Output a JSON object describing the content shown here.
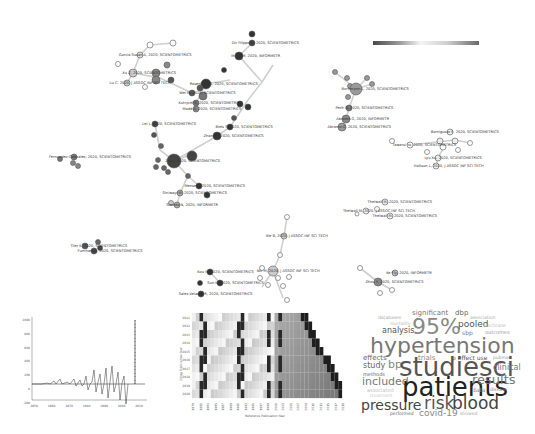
{
  "network": {
    "colorbar": {
      "gradient": [
        "#4a4a4a",
        "#9a9a9a",
        "#f4f4f4",
        "#cfcfcf",
        "#6a6a6a"
      ]
    },
    "nodes": [
      {
        "label": "Garcia Susan A, 2020, SCIENTOMETRICS",
        "x": 140,
        "y": 55,
        "r": 3,
        "fill": "#ddd"
      },
      {
        "label": "Xu Z, 2020, SCIENTOMETRICS",
        "x": 133,
        "y": 73,
        "r": 4,
        "fill": "#ccc"
      },
      {
        "label": "Lu C, 2020, J ASSOC INF SCI TECH",
        "x": 127,
        "y": 83,
        "r": 3,
        "fill": "#ccc"
      },
      {
        "label": "Dir Filippo D, 2020, SCIENTOMETRICS",
        "x": 252,
        "y": 43,
        "r": 3,
        "fill": "#444"
      },
      {
        "label": "Mund M, 2020, INFORMETR",
        "x": 239,
        "y": 56,
        "r": 4,
        "fill": "#333"
      },
      {
        "label": "Wei M, 2020, SCIENTOMETRICS",
        "x": 192,
        "y": 93,
        "r": 3,
        "fill": "#555"
      },
      {
        "label": "Rosenberg K, 2020, SCIENTOMETRICS",
        "x": 206,
        "y": 84,
        "r": 5,
        "fill": "#333"
      },
      {
        "label": "Kutrycel E, 2020, SCIENTOMETRICS",
        "x": 196,
        "y": 103,
        "r": 3,
        "fill": "#777"
      },
      {
        "label": "Madd A, 2020, SCIENTOMETRICS",
        "x": 196,
        "y": 109,
        "r": 3,
        "fill": "#888"
      },
      {
        "label": "Lei L, 2020, SCIENTOMETRICS",
        "x": 155,
        "y": 124,
        "r": 3,
        "fill": "#444"
      },
      {
        "label": "Biels S, 2020, SCIENTOMETRICS",
        "x": 230,
        "y": 127,
        "r": 3,
        "fill": "#333"
      },
      {
        "label": "Zhang L, 2020, SCIENTOMETRICS",
        "x": 217,
        "y": 136,
        "r": 4,
        "fill": "#333"
      },
      {
        "label": "Zhu J, 2020, SCIENTOMETRICS",
        "x": 174,
        "y": 161,
        "r": 7,
        "fill": "#444"
      },
      {
        "label": "Fernandez-Gonzalez, 2020, SCIENTOMETRICS",
        "x": 74,
        "y": 157,
        "r": 3,
        "fill": "#777"
      },
      {
        "label": "Mense E, 2020, SCIENTOMETRICS",
        "x": 199,
        "y": 186,
        "r": 3,
        "fill": "#333"
      },
      {
        "label": "Siniwayi M, 2020, SCIENTOMETRICS",
        "x": 180,
        "y": 193,
        "r": 3,
        "fill": "#aaa"
      },
      {
        "label": "Simoes N, 2020, INFORMETR",
        "x": 177,
        "y": 205,
        "r": 3,
        "fill": "#aaa"
      },
      {
        "label": "Bornmann L, 2020, SCIENTOMETRICS",
        "x": 356,
        "y": 89,
        "r": 6,
        "fill": "#999"
      },
      {
        "label": "Pech G, 2020, SCIENTOMETRICS",
        "x": 349,
        "y": 108,
        "r": 3,
        "fill": "#777"
      },
      {
        "label": "Abramo G, 2020, INFORMETR",
        "x": 346,
        "y": 119,
        "r": 4,
        "fill": "#888"
      },
      {
        "label": "Abramo G, 2020, SCIENTOMETRICS",
        "x": 342,
        "y": 127,
        "r": 4,
        "fill": "#999"
      },
      {
        "label": "Bornigusar F, 2020, SCIENTOMETRICS",
        "x": 450,
        "y": 132,
        "r": 3,
        "fill": "#eee"
      },
      {
        "label": "Tawarsi Ya, 2020, SCIENTOMETRICS",
        "x": 410,
        "y": 145,
        "r": 3,
        "fill": "#fff"
      },
      {
        "label": "Lyu Xu, 2020, SCIENTOMETRICS",
        "x": 438,
        "y": 158,
        "r": 3,
        "fill": "#eee"
      },
      {
        "label": "Haltsun L, 2020, J ASSOC INF SCI TECH",
        "x": 436,
        "y": 166,
        "r": 3,
        "fill": "#eee"
      },
      {
        "label": "Thelwall M, 2020, SCIENTOMETRICS",
        "x": 385,
        "y": 202,
        "r": 3,
        "fill": "#eee"
      },
      {
        "label": "Thelwall M, 2020, J ASSOC INF SCI TECH",
        "x": 366,
        "y": 211,
        "r": 3,
        "fill": "#eee"
      },
      {
        "label": "Thelwall M, 2020, SCIENTOMETRICS",
        "x": 390,
        "y": 216,
        "r": 3,
        "fill": "#eee"
      },
      {
        "label": "Xie B, 2020, J ASSOC INF SCI TECH",
        "x": 284,
        "y": 236,
        "r": 3,
        "fill": "#ccc"
      },
      {
        "label": "Kou M, 2020, SCIENTOMETRICS",
        "x": 210,
        "y": 272,
        "r": 3,
        "fill": "#333"
      },
      {
        "label": "Nic M, 2020, J ASSOC INF SCI TECH",
        "x": 273,
        "y": 271,
        "r": 5,
        "fill": "#ccc"
      },
      {
        "label": "Sun M, 2020, SCIENTOMETRICS",
        "x": 220,
        "y": 283,
        "r": 3,
        "fill": "#333"
      },
      {
        "label": "Sales-Velasco R, 2020, SCIENTOMETRICS",
        "x": 201,
        "y": 294,
        "r": 3,
        "fill": "#333"
      },
      {
        "label": "Ke Fly, 2020, INFORMETR",
        "x": 395,
        "y": 273,
        "r": 3,
        "fill": "#bbb"
      },
      {
        "label": "Zhou Y, 2020, SCIENTOMETRICS",
        "x": 378,
        "y": 282,
        "r": 4,
        "fill": "#888"
      },
      {
        "label": "Tiler K, 2020, SCIENTOMETRICS",
        "x": 85,
        "y": 246,
        "r": 3,
        "fill": "#555"
      },
      {
        "label": "Furnham A, 2020, SCIENTOMETRICS",
        "x": 94,
        "y": 251,
        "r": 3,
        "fill": "#444"
      }
    ]
  },
  "line_chart": {
    "x_ticks": [
      "1950",
      "1960",
      "1970",
      "1980",
      "1990",
      "2000",
      "2010"
    ],
    "y_ticks": [
      "1000",
      "800",
      "600",
      "400",
      "200",
      "0",
      "-200"
    ]
  },
  "heatmap": {
    "y_label": "Citing Publication Year",
    "x_label": "Reference Publication Year",
    "y_ticks": [
      "2011",
      "2012",
      "2013",
      "2014",
      "2015",
      "2016",
      "2017",
      "2018",
      "2019",
      "2020"
    ],
    "x_ticks": [
      "1979",
      "1981",
      "1983",
      "1985",
      "1987",
      "1989",
      "1991",
      "1993",
      "1995",
      "1997",
      "1999",
      "2001",
      "2003",
      "2005",
      "2007",
      "2009",
      "2011",
      "2013",
      "2015",
      "2017",
      "2019"
    ]
  },
  "wordcloud": {
    "words": [
      {
        "text": "significant",
        "x": 52,
        "y": 2,
        "size": 7,
        "color": "#777"
      },
      {
        "text": "dbp",
        "x": 95,
        "y": 2,
        "size": 7,
        "color": "#666"
      },
      {
        "text": "databases",
        "x": 18,
        "y": 8,
        "size": 4.5,
        "color": "#aaa"
      },
      {
        "text": "association",
        "x": 110,
        "y": 8,
        "size": 4.5,
        "color": "#aaa"
      },
      {
        "text": "mortality",
        "x": 30,
        "y": 14,
        "size": 4.5,
        "color": "#bbb"
      },
      {
        "text": "analysis",
        "x": 22,
        "y": 19,
        "size": 8,
        "color": "#555"
      },
      {
        "text": "95%",
        "x": 52,
        "y": 8,
        "size": 22,
        "color": "#888"
      },
      {
        "text": "pooled",
        "x": 98,
        "y": 12,
        "size": 9,
        "color": "#555"
      },
      {
        "text": "cochrane",
        "x": 125,
        "y": 16,
        "size": 4.5,
        "color": "#bbb"
      },
      {
        "text": "sbp",
        "x": 102,
        "y": 22,
        "size": 6,
        "color": "#777"
      },
      {
        "text": "outcomes",
        "x": 125,
        "y": 22,
        "size": 5,
        "color": "#999"
      },
      {
        "text": "hypertension",
        "x": 10,
        "y": 27,
        "size": 22,
        "color": "#777"
      },
      {
        "text": "effects",
        "x": 3,
        "y": 47,
        "size": 7,
        "color": "#666"
      },
      {
        "text": "trials",
        "x": 58,
        "y": 47,
        "size": 7,
        "color": "#888"
      },
      {
        "text": "p effect use",
        "x": 92,
        "y": 47,
        "size": 6,
        "color": "#555"
      },
      {
        "text": "pubmed",
        "x": 133,
        "y": 48,
        "size": 4.5,
        "color": "#999"
      },
      {
        "text": "study",
        "x": 3,
        "y": 54,
        "size": 8,
        "color": "#666"
      },
      {
        "text": "bp",
        "x": 28,
        "y": 51,
        "size": 11,
        "color": "#888"
      },
      {
        "text": "studiesci",
        "x": 39,
        "y": 46,
        "size": 26,
        "color": "#555"
      },
      {
        "text": "clinical",
        "x": 133,
        "y": 56,
        "size": 8,
        "color": "#777"
      },
      {
        "text": "methods",
        "x": 3,
        "y": 64,
        "size": 5,
        "color": "#666"
      },
      {
        "text": "included",
        "x": 2,
        "y": 68,
        "size": 11,
        "color": "#777"
      },
      {
        "text": "patients",
        "x": 42,
        "y": 66,
        "size": 26,
        "color": "#222"
      },
      {
        "text": "results",
        "x": 112,
        "y": 65,
        "size": 13,
        "color": "#777"
      },
      {
        "text": "data",
        "x": 112,
        "y": 79,
        "size": 6,
        "color": "#888"
      },
      {
        "text": "disease",
        "x": 130,
        "y": 80,
        "size": 4.5,
        "color": "#888"
      },
      {
        "text": "associated",
        "x": 7,
        "y": 80,
        "size": 5,
        "color": "#bbb"
      },
      {
        "text": "treatment",
        "x": 10,
        "y": 86,
        "size": 4.5,
        "color": "#ccc"
      },
      {
        "text": "pressure",
        "x": 1,
        "y": 90,
        "size": 14,
        "color": "#444"
      },
      {
        "text": "risk",
        "x": 64,
        "y": 87,
        "size": 17,
        "color": "#555"
      },
      {
        "text": "blood",
        "x": 92,
        "y": 87,
        "size": 17,
        "color": "#444"
      },
      {
        "text": "performed",
        "x": 30,
        "y": 104,
        "size": 4.5,
        "color": "#666"
      },
      {
        "text": "covid-19",
        "x": 59,
        "y": 101,
        "size": 9,
        "color": "#888"
      },
      {
        "text": "showed",
        "x": 100,
        "y": 104,
        "size": 4.5,
        "color": "#aaa"
      }
    ]
  }
}
